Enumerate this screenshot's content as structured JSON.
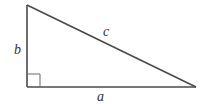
{
  "diagram": {
    "labels": {
      "a": "a",
      "b": "b",
      "c": "c"
    },
    "vertices": {
      "top": [
        27,
        5
      ],
      "right_angle": [
        27,
        87
      ],
      "right": [
        196,
        87
      ]
    },
    "right_angle_marker_size": 13,
    "colors": {
      "stroke": "#4a4a4a",
      "label": "#333333",
      "background": "#ffffff"
    }
  }
}
